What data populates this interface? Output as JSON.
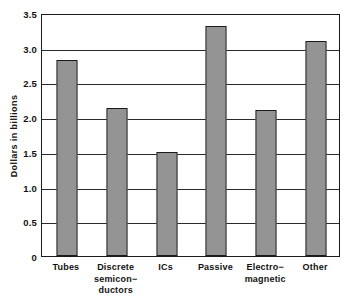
{
  "chart_data": {
    "type": "bar",
    "title": "",
    "subtitle": "",
    "xlabel": "",
    "ylabel": "Dollars  in  billions",
    "categories": [
      "Tubes",
      "Discrete semicon−ductors",
      "ICs",
      "Passive",
      "Electro−magnetic",
      "Other"
    ],
    "category_lines": [
      [
        "Tubes"
      ],
      [
        "Discrete",
        "semicon−",
        "ductors"
      ],
      [
        "ICs"
      ],
      [
        "Passive"
      ],
      [
        "Electro−",
        "magnetic"
      ],
      [
        "Other"
      ]
    ],
    "values": [
      2.86,
      2.16,
      1.51,
      3.35,
      2.13,
      3.14
    ],
    "ylim": [
      0,
      3.5
    ],
    "yticks": [
      3.5,
      3.0,
      2.5,
      2.0,
      1.5,
      1.0,
      0.5,
      0
    ],
    "ytick_labels": [
      "3.5",
      "3.0",
      "2.5",
      "2.0",
      "1.5",
      "1.0",
      "0.5",
      "0"
    ],
    "grid": true,
    "grid_axis": "y",
    "legend": false,
    "legend_position": "none",
    "bar_fill": "#b9b9b9",
    "bar_pattern": "checker-dither",
    "bar_edge_color": "#1b1b1b",
    "axis_color": "#1b1b1b",
    "background": "#ffffff"
  }
}
